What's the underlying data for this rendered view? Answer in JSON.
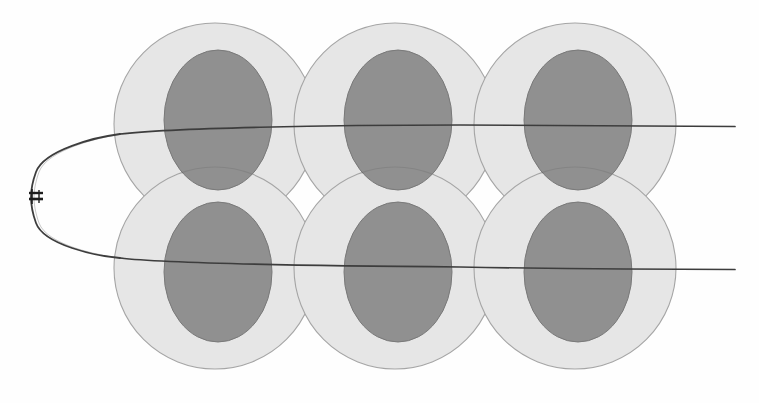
{
  "canvas": {
    "width": 759,
    "height": 403,
    "background": "#fefefe",
    "title": "Overlapping circular regions traversed by a looped beam path"
  },
  "palette": {
    "outer_fill": "#d8d8d8",
    "outer_stroke": "#6e6e6e",
    "inner_fill": "#7b7b7b",
    "inner_stroke": "#5e5e5e",
    "line_color": "#3a3a3a",
    "marker_color": "#1a1a1a",
    "background": "#fefefe"
  },
  "geometry": {
    "outer_radius": 101,
    "inner_rx": 54,
    "inner_ry": 70,
    "outer_opacity": 0.62,
    "inner_opacity": 0.82,
    "row_y": [
      124,
      268
    ],
    "column_x": [
      215,
      395,
      575
    ]
  },
  "chart_data": {
    "type": "scatter",
    "title": "Overlapping circular regions traversed by a looped beam path",
    "xlabel": "",
    "ylabel": "",
    "xlim": [
      0,
      759
    ],
    "ylim": [
      0,
      403
    ],
    "grid": false,
    "legend": "none",
    "series": [
      {
        "name": "outer-circles",
        "shape": "circle",
        "radius": 101,
        "points": [
          {
            "label": "top-left",
            "x": 215,
            "y": 124
          },
          {
            "label": "top-center",
            "x": 395,
            "y": 124
          },
          {
            "label": "top-right",
            "x": 575,
            "y": 124
          },
          {
            "label": "bottom-left",
            "x": 215,
            "y": 268
          },
          {
            "label": "bottom-center",
            "x": 395,
            "y": 268
          },
          {
            "label": "bottom-right",
            "x": 575,
            "y": 268
          }
        ]
      },
      {
        "name": "inner-ellipses",
        "shape": "ellipse",
        "rx": 54,
        "ry": 70,
        "points": [
          {
            "label": "top-left",
            "x": 218,
            "y": 120
          },
          {
            "label": "top-center",
            "x": 398,
            "y": 120
          },
          {
            "label": "top-right",
            "x": 578,
            "y": 120
          },
          {
            "label": "bottom-left",
            "x": 218,
            "y": 272
          },
          {
            "label": "bottom-center",
            "x": 398,
            "y": 272
          },
          {
            "label": "bottom-right",
            "x": 578,
            "y": 272
          }
        ]
      },
      {
        "name": "beam-path",
        "shape": "path",
        "description": "Two near-horizontal traces joined at the left by a rounded U-turn loop",
        "upper_trace": {
          "x_start": 120,
          "y_start": 128,
          "x_end": 735,
          "y_end": 126
        },
        "lower_trace": {
          "x_start": 120,
          "y_start": 266,
          "x_end": 735,
          "y_end": 269
        },
        "loop_left_x": 31,
        "loop_top_y": 128,
        "loop_bottom_y": 266
      },
      {
        "name": "loop-marker",
        "shape": "tick-pair",
        "points": [
          {
            "label": "clamp",
            "x": 36,
            "y": 198
          }
        ]
      }
    ]
  },
  "elements": {
    "figure_caption": "",
    "annotations": []
  }
}
